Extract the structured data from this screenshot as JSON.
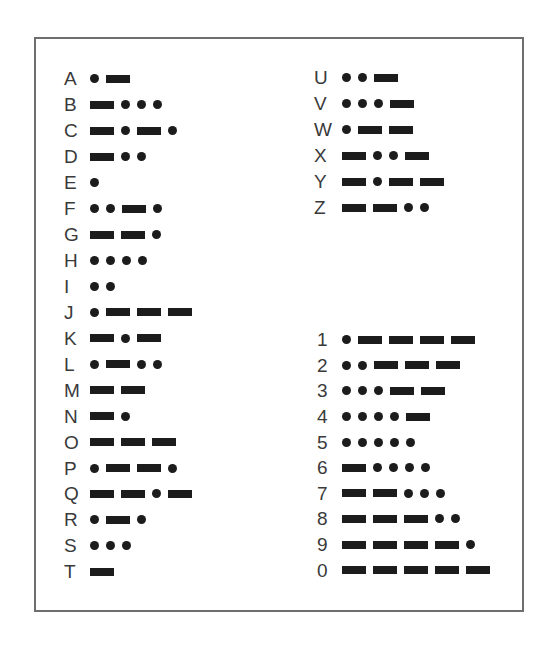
{
  "chart": {
    "letters_left": [
      {
        "char": "A",
        "code": ".-"
      },
      {
        "char": "B",
        "code": "-..."
      },
      {
        "char": "C",
        "code": "-.-."
      },
      {
        "char": "D",
        "code": "-.."
      },
      {
        "char": "E",
        "code": "."
      },
      {
        "char": "F",
        "code": "..-."
      },
      {
        "char": "G",
        "code": "--."
      },
      {
        "char": "H",
        "code": "...."
      },
      {
        "char": "I",
        "code": ".."
      },
      {
        "char": "J",
        "code": ".---"
      },
      {
        "char": "K",
        "code": "-.-"
      },
      {
        "char": "L",
        "code": ".-.."
      },
      {
        "char": "M",
        "code": "--"
      },
      {
        "char": "N",
        "code": "-."
      },
      {
        "char": "O",
        "code": "---"
      },
      {
        "char": "P",
        "code": ".--."
      },
      {
        "char": "Q",
        "code": "--.-"
      },
      {
        "char": "R",
        "code": ".-."
      },
      {
        "char": "S",
        "code": "..."
      },
      {
        "char": "T",
        "code": "-"
      }
    ],
    "letters_right": [
      {
        "char": "U",
        "code": "..-"
      },
      {
        "char": "V",
        "code": "...-"
      },
      {
        "char": "W",
        "code": ".--"
      },
      {
        "char": "X",
        "code": "-..-"
      },
      {
        "char": "Y",
        "code": "-.--"
      },
      {
        "char": "Z",
        "code": "--.."
      }
    ],
    "numbers": [
      {
        "char": "1",
        "code": ".----"
      },
      {
        "char": "2",
        "code": "..---"
      },
      {
        "char": "3",
        "code": "...--"
      },
      {
        "char": "4",
        "code": "....-"
      },
      {
        "char": "5",
        "code": "....."
      },
      {
        "char": "6",
        "code": "-...."
      },
      {
        "char": "7",
        "code": "--..."
      },
      {
        "char": "8",
        "code": "---.."
      },
      {
        "char": "9",
        "code": "----."
      },
      {
        "char": "0",
        "code": "-----"
      }
    ]
  },
  "colors": {
    "frame_border": "#6e6e6e",
    "symbol_fill": "#1c1c1c",
    "label_text": "#3a3a3a",
    "background": "#ffffff"
  }
}
